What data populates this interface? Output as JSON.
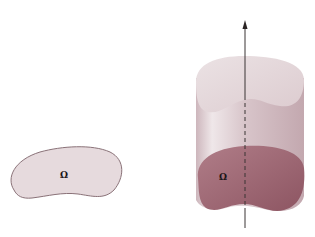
{
  "figure": {
    "left_region": {
      "label": "Ω",
      "fill": "#e6dadd",
      "stroke": "#8a7278"
    },
    "cylinder": {
      "label": "Ω",
      "top_fill": "#e8dde0",
      "side_fill": "#d9c6cb",
      "base_fill": "#9c6470",
      "axis_color": "#3a3434"
    }
  }
}
